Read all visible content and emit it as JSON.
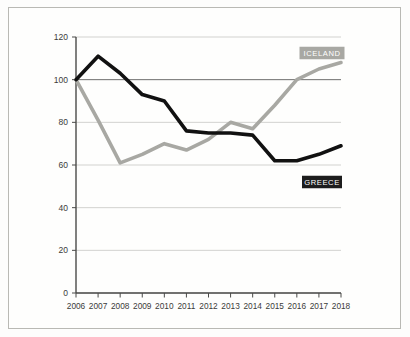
{
  "chart_data": {
    "type": "line",
    "title": "",
    "subtitle": "",
    "xlabel": "",
    "ylabel": "",
    "x": [
      2006,
      2007,
      2008,
      2009,
      2010,
      2011,
      2012,
      2013,
      2014,
      2015,
      2016,
      2017,
      2018
    ],
    "xtick_labels": [
      "2006",
      "2007",
      "2008",
      "2009",
      "2010",
      "2011",
      "2012",
      "2013",
      "2014",
      "2015",
      "2016",
      "2017",
      "2018"
    ],
    "ytick_labels": [
      "0",
      "20",
      "40",
      "60",
      "80",
      "100",
      "120"
    ],
    "yticks": [
      0,
      20,
      40,
      60,
      80,
      100,
      120
    ],
    "ylim": [
      0,
      120
    ],
    "xlim": [
      2006,
      2018
    ],
    "grid": true,
    "grid_axis": "y",
    "legend_position": "inside-right",
    "baseline_value": 100,
    "series": [
      {
        "name": "GREECE",
        "color": "#111111",
        "stroke_width": 3.6,
        "values": [
          100,
          111,
          103,
          93,
          90,
          76,
          75,
          75,
          74,
          62,
          62,
          65,
          69
        ]
      },
      {
        "name": "ICELAND",
        "color": "#a8a8a3",
        "stroke_width": 3.6,
        "values": [
          100,
          81,
          61,
          65,
          70,
          67,
          72,
          80,
          77,
          88,
          100,
          105,
          108
        ]
      }
    ],
    "legend_entries": [
      {
        "label": "ICELAND",
        "box_color": "#a8a8a3",
        "text_color": "#ffffff"
      },
      {
        "label": "GREECE",
        "box_color": "#1d1d1d",
        "text_color": "#ffffff"
      }
    ]
  },
  "colors": {
    "greece": "#111111",
    "iceland": "#a8a8a3",
    "grid": "#d2d2cf",
    "baseline": "#6e6e6c",
    "axis": "#4a4a48",
    "frame_border": "#b9b9b4",
    "background": "#fefefd"
  }
}
